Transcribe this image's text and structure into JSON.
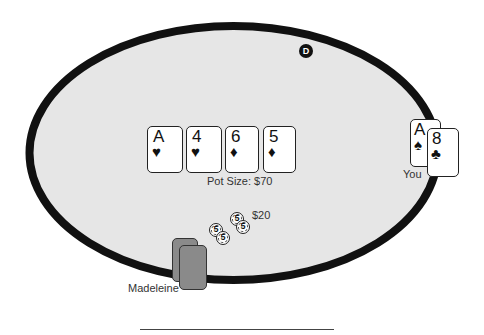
{
  "table": {
    "felt_color": "#e6e6e6",
    "rail_color": "#111111",
    "dealer_button": {
      "label": "D"
    }
  },
  "community_cards": [
    {
      "rank": "A",
      "suit": "♥",
      "suit_name": "hearts"
    },
    {
      "rank": "4",
      "suit": "♥",
      "suit_name": "hearts"
    },
    {
      "rank": "6",
      "suit": "♦",
      "suit_name": "diamonds"
    },
    {
      "rank": "5",
      "suit": "♦",
      "suit_name": "diamonds"
    }
  ],
  "pot": {
    "label": "Pot Size: $70"
  },
  "bet": {
    "amount_label": "$20",
    "chips": [
      {
        "value": "5"
      },
      {
        "value": "5"
      },
      {
        "value": "5"
      },
      {
        "value": "5"
      }
    ]
  },
  "players": {
    "you": {
      "name": "You",
      "hole_cards": [
        {
          "rank": "A",
          "suit": "♠",
          "suit_name": "spades"
        },
        {
          "rank": "8",
          "suit": "♣",
          "suit_name": "clubs"
        }
      ]
    },
    "opponent": {
      "name": "Madeleine",
      "hole_cards": [
        "face-down",
        "face-down"
      ]
    }
  }
}
